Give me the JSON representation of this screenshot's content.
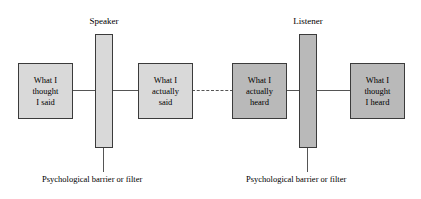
{
  "diagram": {
    "colors": {
      "box_light": "#d9d9d9",
      "box_dark": "#b9b9b9",
      "border": "#3b3b3b",
      "line": "#555555",
      "background": "#ffffff"
    },
    "bars": [
      {
        "id": "speaker",
        "label": "Speaker"
      },
      {
        "id": "listener",
        "label": "Listener"
      }
    ],
    "boxes": [
      {
        "id": "thought-said",
        "line1": "What I",
        "line2": "thought",
        "line3": "I said"
      },
      {
        "id": "actually-said",
        "line1": "What I",
        "line2": "actually",
        "line3": "said"
      },
      {
        "id": "actually-heard",
        "line1": "What I",
        "line2": "actually",
        "line3": "heard"
      },
      {
        "id": "thought-heard",
        "line1": "What I",
        "line2": "thought",
        "line3": "I heard"
      }
    ],
    "captions": [
      {
        "id": "speaker",
        "text": "Psychological barrier or filter"
      },
      {
        "id": "listener",
        "text": "Psychological barrier or filter"
      }
    ]
  }
}
